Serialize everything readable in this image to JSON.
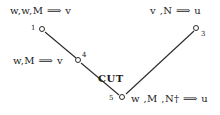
{
  "figure": {
    "background_color": "#ffffff",
    "ink_color": "#1b1b1b",
    "width": 220,
    "height": 115
  },
  "rule": {
    "label": "CUT"
  },
  "nodes": [
    {
      "id": "1",
      "x": 42,
      "y": 29,
      "id_x": 31,
      "id_y": 25
    },
    {
      "id": "4",
      "x": 78,
      "y": 60,
      "id_x": 82,
      "id_y": 52
    },
    {
      "id": "3",
      "x": 196,
      "y": 28,
      "id_x": 201,
      "id_y": 31
    },
    {
      "id": "5",
      "x": 122,
      "y": 97,
      "id_x": 109,
      "id_y": 95
    }
  ],
  "edges": [
    {
      "from": "1",
      "to": "4"
    },
    {
      "from": "4",
      "to": "5"
    },
    {
      "from": "5",
      "to": "3"
    }
  ],
  "sequents": [
    {
      "name": "top-left",
      "text": "w,w,M ⟹ v",
      "x": 10,
      "y": 6
    },
    {
      "name": "top-right",
      "text": "v ,N ⟹ u",
      "x": 150,
      "y": 6
    },
    {
      "name": "mid-left",
      "text": "w,M ⟹ v",
      "x": 13,
      "y": 56
    },
    {
      "name": "bottom-right",
      "text": "w ,M ,N† ⟹ u",
      "x": 131,
      "y": 94
    }
  ],
  "rule_label_position": {
    "x": 98,
    "y": 74
  }
}
